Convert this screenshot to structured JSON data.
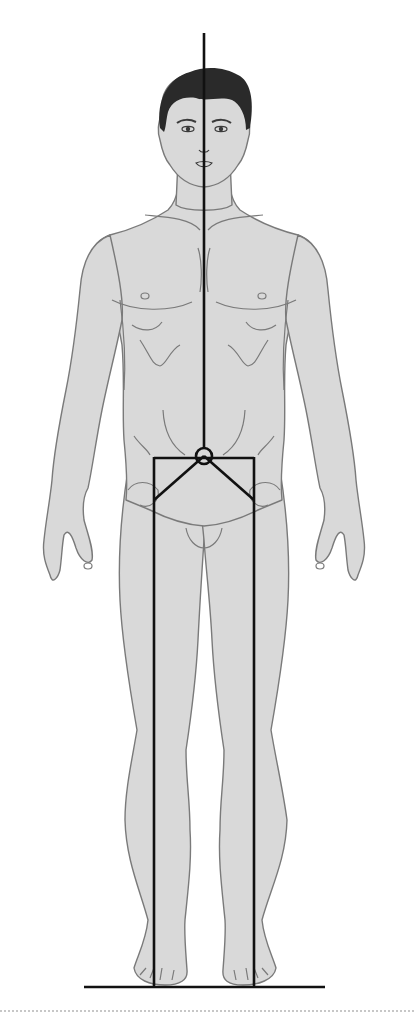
{
  "diagram": {
    "subject": "front-view human figure with line of gravity and center of mass",
    "colors": {
      "background": "#ffffff",
      "skin": "#d9d9d9",
      "outline": "#7a7a7a",
      "hair": "#2a2a2a",
      "axis_lines": "#111111",
      "dotted_rule": "#b5b5b5"
    },
    "elements": {
      "gravity_line": {
        "x": 204,
        "y_start": 33,
        "y_end": 456
      },
      "center_of_mass": {
        "cx": 204,
        "cy": 456,
        "r": 8
      },
      "hip_bar": {
        "x1": 154,
        "x2": 254,
        "y": 458
      },
      "hip_diagonals": [
        {
          "from": [
            204,
            456
          ],
          "to": [
            154,
            500
          ]
        },
        {
          "from": [
            204,
            456
          ],
          "to": [
            254,
            500
          ]
        }
      ],
      "leg_lines": [
        {
          "x": 154,
          "y_start": 458,
          "y_end": 987
        },
        {
          "x": 254,
          "y_start": 458,
          "y_end": 987
        }
      ],
      "ground_line": {
        "x1": 84,
        "x2": 325,
        "y": 987
      },
      "bottom_rule": {
        "y": 1011
      }
    }
  }
}
